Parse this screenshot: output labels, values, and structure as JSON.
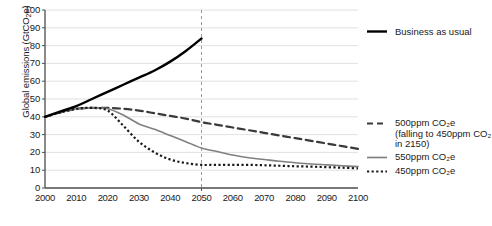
{
  "chart_data": {
    "type": "line",
    "title": "",
    "xlabel": "",
    "ylabel": "Global emissions (GtCO2e)",
    "ylabel_rich": "Global emissions (GtCO₂e)",
    "xlim": [
      2000,
      2100
    ],
    "ylim": [
      0,
      100
    ],
    "grid": true,
    "grid_axis": "y",
    "legend_position": "right",
    "xticks": [
      "2000",
      "2010",
      "2020",
      "2030",
      "2040",
      "2050",
      "2060",
      "2070",
      "2080",
      "2090",
      "2100"
    ],
    "yticks": [
      "0",
      "10",
      "20",
      "30",
      "40",
      "50",
      "60",
      "70",
      "80",
      "90",
      "100"
    ],
    "annotations": [
      {
        "type": "vertical-dashed-line",
        "x": 2050,
        "label": "2050 reference line"
      }
    ],
    "x": [
      2000,
      2005,
      2010,
      2015,
      2020,
      2025,
      2030,
      2035,
      2040,
      2045,
      2050,
      2055,
      2060,
      2065,
      2070,
      2075,
      2080,
      2085,
      2090,
      2095,
      2100
    ],
    "series": [
      {
        "name": "Business as usual",
        "style": "solid",
        "color": "#000000",
        "width": 2.4,
        "x": [
          2000,
          2005,
          2010,
          2015,
          2020,
          2025,
          2030,
          2035,
          2040,
          2045,
          2050
        ],
        "values": [
          40,
          43,
          46,
          50,
          54,
          58,
          62,
          66,
          71,
          77,
          84
        ]
      },
      {
        "name": "500ppm CO2e (falling to 450ppm CO2 in 2150)",
        "style": "dashed",
        "color": "#3a3a3a",
        "width": 2.2,
        "x": [
          2000,
          2005,
          2010,
          2015,
          2020,
          2025,
          2030,
          2035,
          2040,
          2045,
          2050,
          2055,
          2060,
          2065,
          2070,
          2075,
          2080,
          2085,
          2090,
          2095,
          2100
        ],
        "values": [
          40,
          42.5,
          44.5,
          45,
          45,
          44.5,
          43.5,
          42,
          40.5,
          39,
          37,
          35.5,
          34,
          32.5,
          31,
          29.5,
          28,
          26.5,
          25,
          23.5,
          22
        ]
      },
      {
        "name": "550ppm CO2e",
        "style": "solid",
        "color": "#808080",
        "width": 1.6,
        "x": [
          2000,
          2005,
          2010,
          2015,
          2020,
          2025,
          2030,
          2035,
          2040,
          2045,
          2050,
          2055,
          2060,
          2065,
          2070,
          2075,
          2080,
          2085,
          2090,
          2095,
          2100
        ],
        "values": [
          40,
          42.5,
          44.5,
          45,
          44.5,
          41,
          36,
          33,
          29.5,
          26,
          22.5,
          20.5,
          18.5,
          17,
          16,
          15,
          14.2,
          13.5,
          13,
          12.5,
          12
        ]
      },
      {
        "name": "450ppm CO2e",
        "style": "dotted",
        "color": "#1a1a1a",
        "width": 2.2,
        "x": [
          2000,
          2005,
          2010,
          2015,
          2020,
          2025,
          2030,
          2035,
          2040,
          2045,
          2050,
          2055,
          2060,
          2065,
          2070,
          2075,
          2080,
          2085,
          2090,
          2095,
          2100
        ],
        "values": [
          40,
          42.5,
          44.5,
          45,
          43.5,
          35,
          26,
          20,
          16,
          14,
          13,
          13,
          13,
          13,
          12.8,
          12.5,
          12.2,
          12,
          11.7,
          11.4,
          11
        ]
      }
    ]
  },
  "legend_top": {
    "label": "Business as usual",
    "swatch": "solid-black-line"
  },
  "legend_block": {
    "entries": [
      {
        "swatch": "dashed-line",
        "line1": "500ppm CO₂e",
        "line2": "(falling to 450ppm CO₂",
        "line3": "in 2150)"
      },
      {
        "swatch": "solid-gray-line",
        "line1": "550ppm CO₂e"
      },
      {
        "swatch": "dotted-line",
        "line1": "450ppm CO₂e"
      }
    ]
  },
  "axis": {
    "y_title_prefix": "Global emissions (GtCO",
    "y_title_sub": "2",
    "y_title_suffix": "e)"
  },
  "colors": {
    "axis": "#4d4d4d",
    "grid": "#d9d9d9",
    "bau": "#000000",
    "ppm500": "#3a3a3a",
    "ppm550": "#808080",
    "ppm450": "#1a1a1a",
    "refline": "#999999",
    "text": "#1a1a1a"
  }
}
